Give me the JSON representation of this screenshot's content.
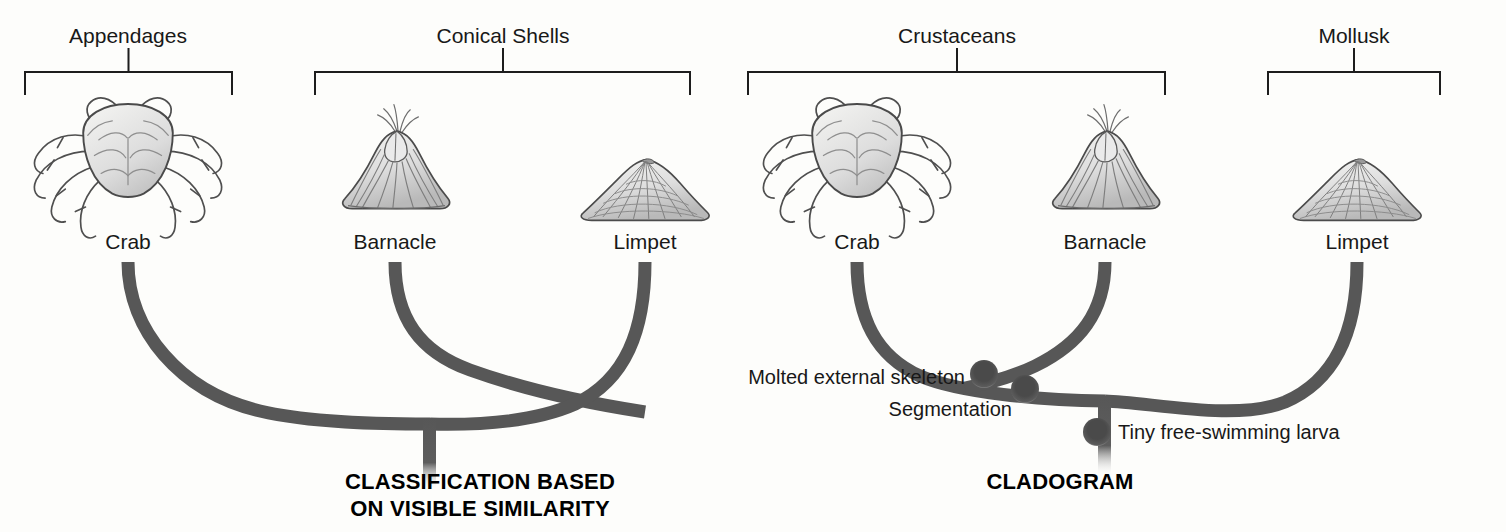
{
  "figure": {
    "width": 1506,
    "height": 532,
    "background": "#fdfdfb",
    "branch_color": "#575757",
    "node_color": "#4a4a4a",
    "bracket_color": "#1d1d1d",
    "text_color": "#181818"
  },
  "panels": [
    {
      "id": "classification",
      "caption": "CLASSIFICATION BASED\nON VISIBLE SIMILARITY",
      "caption_x": 480,
      "caption_y": 468,
      "root_x": 430,
      "groups": [
        {
          "label": "Appendages",
          "label_x": 128,
          "label_y": 24,
          "left": 25,
          "right": 232,
          "bar_y": 72,
          "tick_top": 48
        },
        {
          "label": "Conical Shells",
          "label_x": 503,
          "label_y": 24,
          "left": 315,
          "right": 690,
          "bar_y": 72,
          "tick_top": 48
        }
      ],
      "taxa": [
        {
          "name": "Crab",
          "icon": "crab-illustration",
          "x": 128,
          "label_y": 230,
          "branch_top": 262
        },
        {
          "name": "Barnacle",
          "icon": "barnacle-illustration",
          "x": 395,
          "label_y": 230,
          "branch_top": 262
        },
        {
          "name": "Limpet",
          "icon": "limpet-illustration",
          "x": 645,
          "label_y": 230,
          "branch_top": 262
        }
      ],
      "nodes": []
    },
    {
      "id": "cladogram",
      "caption": "CLADOGRAM",
      "caption_x": 1060,
      "caption_y": 468,
      "root_x": 1105,
      "groups": [
        {
          "label": "Crustaceans",
          "label_x": 957,
          "label_y": 24,
          "left": 748,
          "right": 1165,
          "bar_y": 72,
          "tick_top": 48
        },
        {
          "label": "Mollusk",
          "label_x": 1354,
          "label_y": 24,
          "left": 1268,
          "right": 1440,
          "bar_y": 72,
          "tick_top": 48
        }
      ],
      "taxa": [
        {
          "name": "Crab",
          "icon": "crab-illustration",
          "x": 857,
          "label_y": 230,
          "branch_top": 262
        },
        {
          "name": "Barnacle",
          "icon": "barnacle-illustration",
          "x": 1105,
          "label_y": 230,
          "branch_top": 262
        },
        {
          "name": "Limpet",
          "icon": "limpet-illustration",
          "x": 1357,
          "label_y": 230,
          "branch_top": 262
        }
      ],
      "nodes": [
        {
          "trait": "Molted external skeleton",
          "cx": 984,
          "cy": 374,
          "label_x": 965,
          "label_y": 366,
          "align": "right"
        },
        {
          "trait": "Segmentation",
          "cx": 1025,
          "cy": 388,
          "label_x": 1012,
          "label_y": 398,
          "align": "right"
        },
        {
          "trait": "Tiny free-swimming larva",
          "cx": 1097,
          "cy": 432,
          "label_x": 1118,
          "label_y": 421,
          "align": "left"
        }
      ]
    }
  ]
}
